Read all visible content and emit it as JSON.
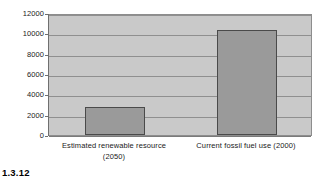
{
  "caption": "1.3.12",
  "chart_data": {
    "type": "bar",
    "title": "",
    "xlabel": "",
    "ylabel": "",
    "categories": [
      "Estimated renewable resource (2050)",
      "Current fossil fuel use (2000)"
    ],
    "category_lines": [
      [
        "Estimated renewable resource",
        "(2050)"
      ],
      [
        "Current fossil fuel use (2000)",
        ""
      ]
    ],
    "values": [
      2800,
      10300
    ],
    "ylim": [
      0,
      12000
    ],
    "yticks": [
      0,
      2000,
      4000,
      6000,
      8000,
      10000,
      12000
    ],
    "ytick_labels": [
      "0",
      "2000",
      "4000",
      "6000",
      "8000",
      "10000",
      "12000"
    ],
    "grid": true,
    "legend": false,
    "colors": {
      "bar_fill": "#9a9a9a",
      "bar_border": "#4a4a4a",
      "plot_background": "#c9c9c9",
      "gridline": "#8f8f8f",
      "axis": "#6f6f6f",
      "text": "#1a1a1a",
      "page_background": "#ffffff"
    }
  }
}
